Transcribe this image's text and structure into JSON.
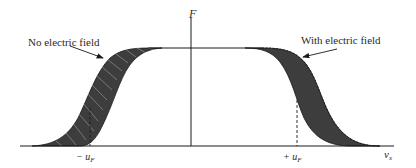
{
  "diagram": {
    "type": "distribution-function-shift",
    "axes": {
      "y_label": "F",
      "x_label": "v",
      "x_label_subscript": "x"
    },
    "annotations": {
      "left_label": "No electric field",
      "right_label": "With electric field"
    },
    "ticks": {
      "neg_fermi": "− u",
      "neg_fermi_sub": "F",
      "pos_fermi": "+ u",
      "pos_fermi_sub": "F"
    },
    "colors": {
      "fill": "#3d3d3d",
      "stroke": "#1a1a1a",
      "background": "#ffffff"
    }
  }
}
